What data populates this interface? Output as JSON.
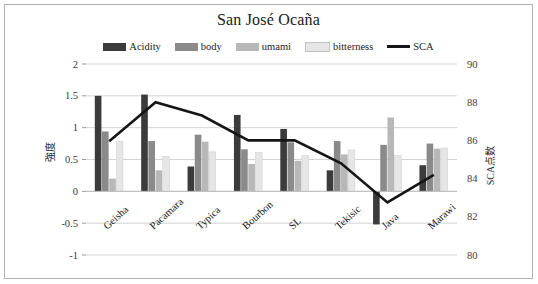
{
  "chart_data": {
    "type": "bar",
    "title": "San José Ocaña",
    "xlabel": "",
    "ylabel": "強度",
    "y2label": "SCA点数",
    "categories": [
      "Geisha",
      "Pacamara",
      "Typica",
      "Bourbon",
      "SL",
      "Tekisic",
      "Java",
      "Marawi"
    ],
    "ylim": [
      -1,
      2
    ],
    "yticks": [
      "2",
      "1.5",
      "1",
      "0.5",
      "0",
      "-0.5",
      "-1"
    ],
    "ytick_values": [
      2,
      1.5,
      1,
      0.5,
      0,
      -0.5,
      -1
    ],
    "y2lim": [
      80,
      90
    ],
    "y2ticks": [
      "90",
      "88",
      "86",
      "84",
      "82",
      "80"
    ],
    "y2tick_values": [
      90,
      88,
      86,
      84,
      82,
      80
    ],
    "grid": true,
    "legend_position": "top-center",
    "series": [
      {
        "name": "Acidity",
        "kind": "bar",
        "axis": "left",
        "color": "#3b3b3b",
        "values": [
          1.5,
          1.52,
          0.39,
          1.2,
          0.98,
          0.33,
          -0.52,
          0.41
        ]
      },
      {
        "name": "body",
        "kind": "bar",
        "axis": "left",
        "color": "#8a8a8a",
        "values": [
          0.94,
          0.79,
          0.89,
          0.66,
          0.77,
          0.79,
          0.73,
          0.75
        ]
      },
      {
        "name": "umami",
        "kind": "bar",
        "axis": "left",
        "color": "#b8b8b8",
        "values": [
          0.2,
          0.33,
          0.78,
          0.43,
          0.48,
          0.58,
          1.16,
          0.67
        ]
      },
      {
        "name": "bitterness",
        "kind": "bar",
        "axis": "left",
        "color": "#e6e6e6",
        "values": [
          0.78,
          0.55,
          0.62,
          0.61,
          0.56,
          0.65,
          0.56,
          0.68
        ]
      },
      {
        "name": "SCA",
        "kind": "line",
        "axis": "right",
        "color": "#161616",
        "values": [
          85.95,
          88.0,
          87.3,
          86.0,
          86.0,
          84.8,
          82.75,
          84.2
        ]
      }
    ]
  },
  "legend": {
    "items": [
      {
        "label": "Acidity",
        "icon": "bar-swatch-acidity"
      },
      {
        "label": "body",
        "icon": "bar-swatch-body"
      },
      {
        "label": "umami",
        "icon": "bar-swatch-umami"
      },
      {
        "label": "bitterness",
        "icon": "bar-swatch-bitterness"
      },
      {
        "label": "SCA",
        "icon": "line-swatch-sca"
      }
    ]
  },
  "colors": {
    "acidity": "#3b3b3b",
    "body": "#8a8a8a",
    "umami": "#b8b8b8",
    "bitterness": "#e6e6e6",
    "sca_line": "#161616",
    "grid": "#d4d4d4",
    "frame_border": "#b0b0b0",
    "background": "#ffffff"
  }
}
